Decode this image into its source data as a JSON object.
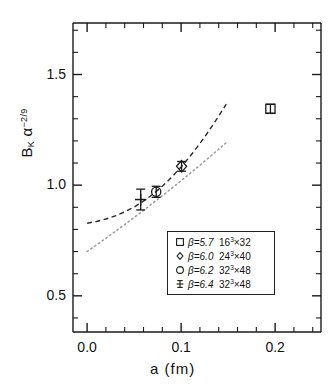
{
  "chart_data": {
    "type": "scatter",
    "title": "",
    "xlabel": "a  (fm)",
    "ylabel": "B_K alpha^{-2/9}",
    "ylabel_base": "B",
    "ylabel_sub": "K",
    "ylabel_alpha": "α",
    "ylabel_exp": "−2/9",
    "xlim": [
      -0.015,
      0.2488
    ],
    "ylim": [
      0.3365,
      1.7327
    ],
    "xticks": [
      0.0,
      0.1,
      0.2
    ],
    "xtick_labels": [
      "0.0",
      "0.1",
      "0.2"
    ],
    "xminor_step": 0.02,
    "yticks": [
      0.5,
      1.0,
      1.5
    ],
    "ytick_labels": [
      "0.5",
      "1.0",
      "1.5"
    ],
    "yminor_step": 0.1,
    "grid": false,
    "legend_position": "lower right",
    "series": [
      {
        "name": "beta=5.7 16^3x32",
        "marker": "square",
        "x": [
          0.195
        ],
        "y": [
          1.345
        ],
        "yerr": [
          0.02
        ]
      },
      {
        "name": "beta=6.0 24^3x40",
        "marker": "diamond",
        "x": [
          0.1005
        ],
        "y": [
          1.085
        ],
        "yerr": [
          0.022
        ]
      },
      {
        "name": "beta=6.2 32^3x48",
        "marker": "circle",
        "x": [
          0.0735
        ],
        "y": [
          0.97
        ],
        "yerr": [
          0.025
        ]
      },
      {
        "name": "beta=6.4 32^3x48",
        "marker": "plus",
        "x": [
          0.057
        ],
        "y": [
          0.935
        ],
        "yerr": [
          0.047
        ]
      }
    ],
    "fits": [
      {
        "name": "dashed-fit",
        "style": "dashed",
        "x": [
          0.0,
          0.01,
          0.02,
          0.03,
          0.04,
          0.05,
          0.06,
          0.07,
          0.08,
          0.09,
          0.1,
          0.11,
          0.12,
          0.13,
          0.14,
          0.148
        ],
        "y": [
          0.828,
          0.836,
          0.847,
          0.861,
          0.879,
          0.901,
          0.928,
          0.959,
          0.995,
          1.036,
          1.082,
          1.133,
          1.188,
          1.248,
          1.312,
          1.366
        ]
      },
      {
        "name": "dotted-fit",
        "style": "dotted",
        "x": [
          0.0,
          0.02,
          0.04,
          0.06,
          0.08,
          0.1,
          0.12,
          0.14,
          0.148
        ],
        "y": [
          0.7,
          0.76,
          0.822,
          0.886,
          0.952,
          1.02,
          1.09,
          1.162,
          1.192
        ]
      }
    ],
    "legend": [
      {
        "marker": "square",
        "beta_label": "β=5.7",
        "volume_base": "16",
        "volume_exp": "3",
        "volume_times": "×32"
      },
      {
        "marker": "diamond",
        "beta_label": "β=6.0",
        "volume_base": "24",
        "volume_exp": "3",
        "volume_times": "×40"
      },
      {
        "marker": "circle",
        "beta_label": "β=6.2",
        "volume_base": "32",
        "volume_exp": "3",
        "volume_times": "×48"
      },
      {
        "marker": "plus",
        "beta_label": "β=6.4",
        "volume_base": "32",
        "volume_exp": "3",
        "volume_times": "×48"
      }
    ],
    "colors": {
      "axis": "#1a1a1a",
      "marker": "#1a1a1a",
      "dashed_fit": "#2a2a2a",
      "dotted_fit": "#9a9a9a",
      "background": "#ffffff"
    }
  },
  "plot_area": {
    "left": 73,
    "right": 321,
    "top": 23,
    "bottom": 332
  }
}
